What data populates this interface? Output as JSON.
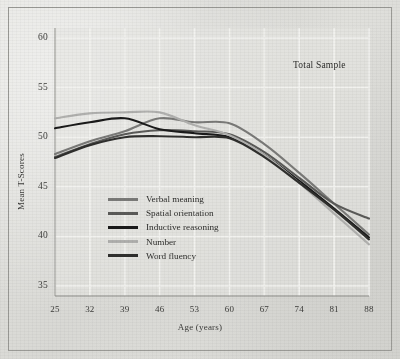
{
  "figure": {
    "annotation": "Total Sample",
    "background_color": "#dcdcd8",
    "frame_color": "#9a9a96"
  },
  "chart_data": {
    "type": "line",
    "title": "",
    "subtitle": "",
    "annotation": "Total Sample",
    "xlabel": "Age (years)",
    "ylabel": "Mean T-Scores",
    "x": [
      25,
      32,
      39,
      46,
      53,
      60,
      67,
      74,
      81,
      88
    ],
    "xtick_labels": [
      "25",
      "32",
      "39",
      "46",
      "53",
      "60",
      "67",
      "74",
      "81",
      "88"
    ],
    "ytick_labels": [
      "35",
      "40",
      "45",
      "50",
      "55",
      "60"
    ],
    "yticks": [
      35,
      40,
      45,
      50,
      55,
      60
    ],
    "xlim": [
      25,
      88
    ],
    "ylim": [
      34,
      61
    ],
    "grid": true,
    "grid_color": "#f2f2ef",
    "legend_position": "lower-left-inside",
    "series": [
      {
        "name": "Verbal meaning",
        "color": "#7a7a78",
        "values": [
          48.3,
          49.6,
          50.6,
          51.9,
          51.5,
          51.4,
          49.3,
          46.4,
          43.3,
          40.2
        ]
      },
      {
        "name": "Spatial orientation",
        "color": "#5a5a58",
        "values": [
          48.0,
          49.3,
          50.3,
          50.7,
          50.6,
          50.3,
          48.5,
          45.9,
          43.3,
          41.8
        ]
      },
      {
        "name": "Inductive reasoning",
        "color": "#1a1a1a",
        "values": [
          50.9,
          51.5,
          51.9,
          50.8,
          50.4,
          50.0,
          48.2,
          45.6,
          42.8,
          39.9
        ]
      },
      {
        "name": "Number",
        "color": "#b0b0ae",
        "values": [
          51.9,
          52.4,
          52.5,
          52.5,
          51.2,
          50.2,
          48.2,
          45.4,
          42.3,
          39.2
        ]
      },
      {
        "name": "Word fluency",
        "color": "#2f2f2d",
        "values": [
          47.9,
          49.2,
          50.0,
          50.1,
          50.0,
          49.9,
          48.0,
          45.4,
          42.7,
          39.7
        ]
      }
    ]
  },
  "legend": {
    "items": [
      {
        "label": "Verbal meaning",
        "color": "#7a7a78"
      },
      {
        "label": "Spatial orientation",
        "color": "#5a5a58"
      },
      {
        "label": "Inductive reasoning",
        "color": "#1a1a1a"
      },
      {
        "label": "Number",
        "color": "#b0b0ae"
      },
      {
        "label": "Word fluency",
        "color": "#2f2f2d"
      }
    ]
  }
}
